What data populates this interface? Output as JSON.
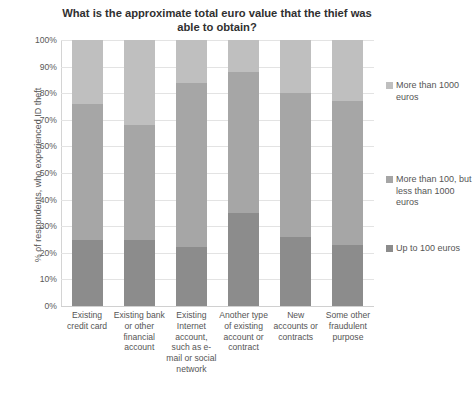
{
  "chart_data": {
    "type": "bar",
    "subtype": "stacked-column-100",
    "title": "What is the approximate total euro value that the thief was able to obtain?",
    "xlabel": "",
    "ylabel": "% of respondents, who experienced ID theft",
    "ylim": [
      0,
      100
    ],
    "ytick_labels": [
      "100%",
      "90%",
      "80%",
      "70%",
      "60%",
      "50%",
      "40%",
      "30%",
      "20%",
      "10%",
      "0%"
    ],
    "ytick_values": [
      100,
      90,
      80,
      70,
      60,
      50,
      40,
      30,
      20,
      10,
      0
    ],
    "grid": true,
    "legend_position": "right",
    "categories": [
      "Existing credit card",
      "Existing bank or other financial account",
      "Existing Internet account, such as e-mail or social network",
      "Another type of existing account or contract",
      "New accounts or contracts",
      "Some other fraudulent purpose"
    ],
    "series": [
      {
        "name": "Up to 100 euros",
        "color": "#8c8c8c",
        "values": [
          25,
          25,
          22,
          35,
          26,
          23
        ]
      },
      {
        "name": "More than 100, but less than 1000 euros",
        "color": "#a6a6a6",
        "values": [
          51,
          43,
          62,
          53,
          54,
          54
        ]
      },
      {
        "name": "More than 1000 euros",
        "color": "#bfbfbf",
        "values": [
          24,
          32,
          16,
          12,
          20,
          23
        ]
      }
    ]
  },
  "legend": {
    "items": [
      {
        "label": "More than 1000 euros",
        "color": "#bfbfbf"
      },
      {
        "label": "More than 100, but less than 1000 euros",
        "color": "#a6a6a6"
      },
      {
        "label": "Up to 100 euros",
        "color": "#8c8c8c"
      }
    ]
  },
  "caption": {
    "text": ""
  }
}
